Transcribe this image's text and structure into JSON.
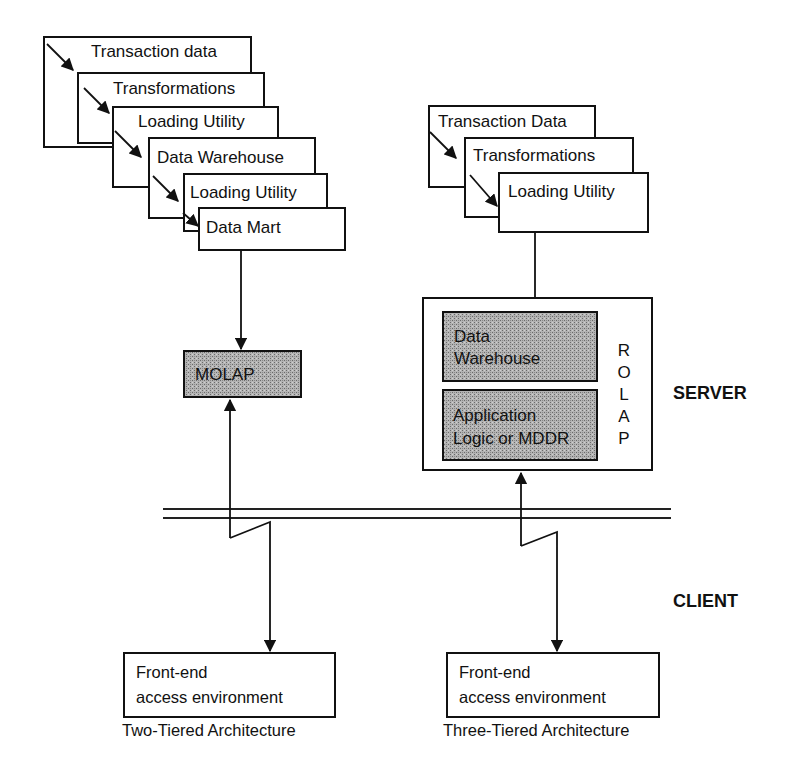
{
  "diagram": {
    "title_regions": {
      "server_label": "SERVER",
      "client_label": "CLIENT"
    },
    "two_tier": {
      "caption": "Two-Tiered Architecture",
      "stack": [
        {
          "label": "Transaction data"
        },
        {
          "label": "Transformations"
        },
        {
          "label": "Loading Utility"
        },
        {
          "label": "Data Warehouse"
        },
        {
          "label": "Loading Utility"
        },
        {
          "label": "Data Mart"
        }
      ],
      "server_box": {
        "label": "MOLAP"
      },
      "client_box": {
        "line1": "Front-end",
        "line2": "access environment"
      }
    },
    "three_tier": {
      "caption": "Three-Tiered Architecture",
      "stack": [
        {
          "label": "Transaction Data"
        },
        {
          "label": "Transformations"
        },
        {
          "label": "Loading Utility"
        }
      ],
      "server_group": {
        "vertical_label": [
          "R",
          "O",
          "L",
          "A",
          "P"
        ],
        "inner": [
          {
            "line1": "Data",
            "line2": "Warehouse"
          },
          {
            "line1": "Application",
            "line2": "Logic or MDDR"
          }
        ]
      },
      "client_box": {
        "line1": "Front-end",
        "line2": "access environment"
      }
    },
    "colors": {
      "ink": "#111111",
      "shade": "#9a9a9a",
      "background": "#ffffff"
    }
  }
}
